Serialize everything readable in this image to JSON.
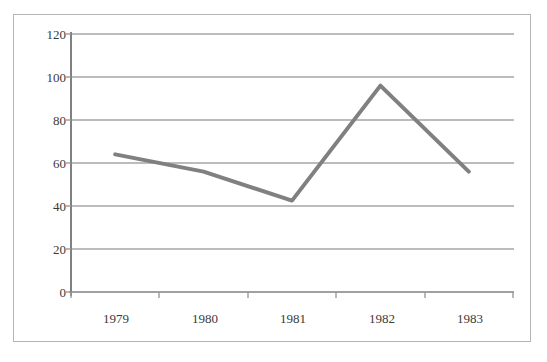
{
  "chart_data": {
    "type": "line",
    "title": "",
    "xlabel": "",
    "ylabel": "",
    "categories": [
      "1979",
      "1980",
      "1981",
      "1982",
      "1983"
    ],
    "values": [
      64,
      56,
      42.5,
      96,
      56
    ],
    "series": [
      {
        "name": "",
        "values": [
          64,
          56,
          42.5,
          96,
          56
        ]
      }
    ],
    "ylim": [
      0,
      120
    ],
    "yticks": [
      0,
      20,
      40,
      60,
      80,
      100,
      120
    ],
    "ytick_labels": [
      "0",
      "20",
      "40",
      "60",
      "80",
      "100",
      "120"
    ],
    "grid": true,
    "grid_axis": "y",
    "legend": false,
    "legend_position": "none",
    "line_color": "#808080",
    "grid_color": "#a6a6a6",
    "axis_color": "#808080",
    "border_color": "#b5b5b5",
    "background_color": "#ffffff",
    "text_color": "#3a3a3a"
  }
}
